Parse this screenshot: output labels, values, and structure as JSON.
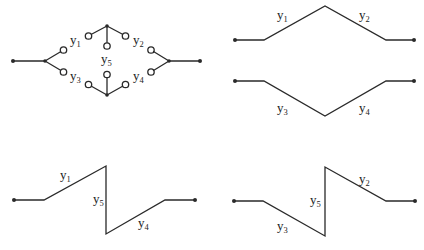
{
  "diagrams": [
    {
      "id": "bridge-network",
      "description": "Bridge switch network with five contacts",
      "labels": {
        "y1": "y",
        "y2": "y",
        "y3": "y",
        "y4": "y",
        "y5": "y"
      },
      "subscripts": {
        "y1": "1",
        "y2": "2",
        "y3": "3",
        "y4": "4",
        "y5": "5"
      }
    },
    {
      "id": "path-y1-y2",
      "labels": {
        "a": "y",
        "b": "y"
      },
      "subscripts": {
        "a": "1",
        "b": "2"
      }
    },
    {
      "id": "path-y3-y4",
      "labels": {
        "a": "y",
        "b": "y"
      },
      "subscripts": {
        "a": "3",
        "b": "4"
      }
    },
    {
      "id": "path-y1-y5-y4",
      "labels": {
        "a": "y",
        "b": "y",
        "c": "y"
      },
      "subscripts": {
        "a": "1",
        "b": "5",
        "c": "4"
      }
    },
    {
      "id": "path-y3-y5-y2",
      "labels": {
        "a": "y",
        "b": "y",
        "c": "y"
      },
      "subscripts": {
        "a": "3",
        "b": "5",
        "c": "2"
      }
    }
  ],
  "colors": {
    "line": "#2a2a2a",
    "background": "#ffffff"
  }
}
